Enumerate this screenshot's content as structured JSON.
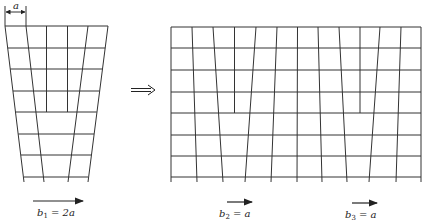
{
  "diagram": {
    "stroke_color": "#333333",
    "left_lattice": {
      "dimension_label": "a",
      "rows": 7,
      "top_columns": 5,
      "bottom_columns": 3,
      "burgers_vector": {
        "symbol": "b",
        "subscript": "1",
        "equals": "= 2a"
      }
    },
    "transition_arrow": "double-arrow-right",
    "right_lattice": {
      "rows": 7,
      "top_columns": 12,
      "bottom_columns": 10,
      "burgers_vectors": [
        {
          "symbol": "b",
          "subscript": "2",
          "equals": "= a"
        },
        {
          "symbol": "b",
          "subscript": "3",
          "equals": "= a"
        }
      ]
    }
  }
}
